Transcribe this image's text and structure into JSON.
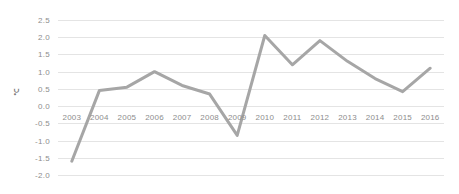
{
  "chart_data": {
    "type": "line",
    "title": "",
    "subtitle": "",
    "xlabel": "",
    "ylabel": "℃",
    "ylim": [
      -2.0,
      2.5
    ],
    "ytick_step": 0.5,
    "yticks": [
      "2.5",
      "2.0",
      "1.5",
      "1.0",
      "0.5",
      "0.0",
      "-0.5",
      "-1.0",
      "-1.5",
      "-2.0"
    ],
    "ytick_values": [
      2.5,
      2.0,
      1.5,
      1.0,
      0.5,
      0.0,
      -0.5,
      -1.0,
      -1.5,
      -2.0
    ],
    "grid": true,
    "grid_axis": "y",
    "legend": false,
    "legend_position": "none",
    "markers": false,
    "categories": [
      "2003",
      "2004",
      "2005",
      "2006",
      "2007",
      "2008",
      "2009",
      "2010",
      "2011",
      "2012",
      "2013",
      "2014",
      "2015",
      "2016"
    ],
    "values": [
      -1.6,
      0.45,
      0.55,
      1.0,
      0.6,
      0.35,
      -0.85,
      2.05,
      1.2,
      1.9,
      1.3,
      0.8,
      0.42,
      1.1
    ],
    "series": [
      {
        "name": "",
        "color": "#a6a6a6",
        "line_width": 3,
        "values": [
          -1.6,
          0.45,
          0.55,
          1.0,
          0.6,
          0.35,
          -0.85,
          2.05,
          1.2,
          1.9,
          1.3,
          0.8,
          0.42,
          1.1
        ]
      }
    ]
  },
  "colors": {
    "series_line": "#a6a6a6",
    "gridline": "#e4e4e4",
    "tick_text": "#8d8d8d",
    "axis_title_text": "#7a7a7a",
    "background": "#ffffff"
  }
}
